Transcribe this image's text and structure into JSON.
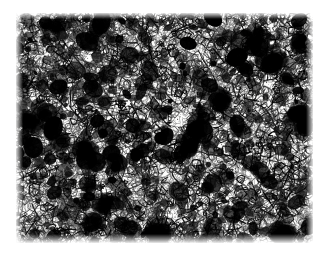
{
  "document": {
    "kind": "scanned-micrograph-figure",
    "page_background": "#ffffff",
    "width": 323,
    "height": 260
  },
  "figure": {
    "name": "metallographic-micrograph",
    "caption": "",
    "scale_bar_text": "",
    "magnification_text": "",
    "label_text": "",
    "plate": {
      "left": 16,
      "top": 13,
      "width": 297,
      "height": 230,
      "border": "none"
    },
    "colors": {
      "matrix": "#fdfdfc",
      "grain_boundary": "#1d1d1d",
      "inclusion": "#000000",
      "paper": "#ffffff",
      "mid_tone": "#6b6b6b"
    },
    "texture": {
      "type": "equiaxed-grain-etch",
      "mean_grain_px": 6.0,
      "grain_count": 5200,
      "boundary_line_width": 1.0,
      "inclusion_count": 210,
      "speckle_density": 0.34,
      "seed": 20240517,
      "density_field": [
        {
          "cx": 0.12,
          "cy": 0.1,
          "radius": 0.42,
          "amount": 0.4
        },
        {
          "cx": 0.84,
          "cy": 0.16,
          "radius": 0.34,
          "amount": 0.34
        },
        {
          "cx": 0.16,
          "cy": 0.84,
          "radius": 0.36,
          "amount": 0.32
        },
        {
          "cx": 0.62,
          "cy": 0.92,
          "radius": 0.34,
          "amount": 0.26
        },
        {
          "cx": 0.97,
          "cy": 0.58,
          "radius": 0.26,
          "amount": 0.22
        },
        {
          "cx": 0.52,
          "cy": 0.46,
          "radius": 0.4,
          "amount": -0.2
        },
        {
          "cx": 0.74,
          "cy": 0.66,
          "radius": 0.26,
          "amount": -0.16
        }
      ],
      "dark_clusters": [
        {
          "cx": 0.8,
          "cy": 0.12,
          "r": 0.05,
          "strength": 0.95
        },
        {
          "cx": 0.86,
          "cy": 0.22,
          "r": 0.032,
          "strength": 0.8
        },
        {
          "cx": 0.61,
          "cy": 0.52,
          "r": 0.034,
          "strength": 0.85
        },
        {
          "cx": 0.58,
          "cy": 0.57,
          "r": 0.026,
          "strength": 0.7
        },
        {
          "cx": 0.13,
          "cy": 0.06,
          "r": 0.04,
          "strength": 0.78
        },
        {
          "cx": 0.3,
          "cy": 0.83,
          "r": 0.03,
          "strength": 0.72
        },
        {
          "cx": 0.47,
          "cy": 0.95,
          "r": 0.034,
          "strength": 0.74
        },
        {
          "cx": 0.9,
          "cy": 0.97,
          "r": 0.03,
          "strength": 0.66
        },
        {
          "cx": 0.05,
          "cy": 0.47,
          "r": 0.026,
          "strength": 0.62
        },
        {
          "cx": 0.69,
          "cy": 0.38,
          "r": 0.024,
          "strength": 0.6
        },
        {
          "cx": 0.23,
          "cy": 0.6,
          "r": 0.022,
          "strength": 0.58
        },
        {
          "cx": 0.95,
          "cy": 0.44,
          "r": 0.028,
          "strength": 0.64
        }
      ]
    }
  }
}
